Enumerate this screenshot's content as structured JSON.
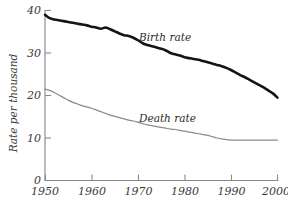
{
  "chart_data": {
    "type": "line",
    "title": "",
    "xlabel": "",
    "ylabel": "Rate per thousand",
    "xlim": [
      1950,
      2000
    ],
    "ylim": [
      0,
      40
    ],
    "grid": false,
    "legend_position": "inline-annotations",
    "x_ticks": [
      "1950",
      "1960",
      "1970",
      "1980",
      "1990",
      "2000"
    ],
    "x_tick_values": [
      1950,
      1960,
      1970,
      1980,
      1990,
      2000
    ],
    "y_ticks": [
      "0",
      "10",
      "20",
      "30",
      "40"
    ],
    "y_tick_values": [
      0,
      10,
      20,
      30,
      40
    ],
    "series": [
      {
        "name": "Birth rate",
        "color": "#141414",
        "annotation": "Birth rate",
        "x": [
          1950,
          1951,
          1952,
          1953,
          1954,
          1955,
          1956,
          1957,
          1958,
          1959,
          1960,
          1961,
          1962,
          1963,
          1964,
          1965,
          1966,
          1967,
          1968,
          1969,
          1970,
          1971,
          1972,
          1973,
          1974,
          1975,
          1976,
          1977,
          1978,
          1979,
          1980,
          1981,
          1982,
          1983,
          1984,
          1985,
          1986,
          1987,
          1988,
          1989,
          1990,
          1991,
          1992,
          1993,
          1994,
          1995,
          1996,
          1997,
          1998,
          1999,
          2000
        ],
        "values": [
          39.0,
          38.2,
          37.9,
          37.7,
          37.5,
          37.3,
          37.1,
          36.9,
          36.7,
          36.5,
          36.2,
          36.0,
          35.7,
          36.0,
          35.6,
          35.1,
          34.6,
          34.2,
          34.0,
          33.6,
          33.0,
          32.3,
          31.9,
          31.6,
          31.3,
          31.0,
          30.6,
          30.0,
          29.7,
          29.4,
          29.0,
          28.8,
          28.6,
          28.4,
          28.1,
          27.8,
          27.5,
          27.2,
          26.9,
          26.5,
          26.0,
          25.4,
          24.8,
          24.3,
          23.7,
          23.1,
          22.5,
          21.9,
          21.2,
          20.5,
          19.5
        ]
      },
      {
        "name": "Death rate",
        "color": "#8c8c8c",
        "annotation": "Death rate",
        "x": [
          1950,
          1951,
          1952,
          1953,
          1954,
          1955,
          1956,
          1957,
          1958,
          1959,
          1960,
          1961,
          1962,
          1963,
          1964,
          1965,
          1966,
          1967,
          1968,
          1969,
          1970,
          1971,
          1972,
          1973,
          1974,
          1975,
          1976,
          1977,
          1978,
          1979,
          1980,
          1981,
          1982,
          1983,
          1984,
          1985,
          1986,
          1987,
          1988,
          1989,
          1990,
          1991,
          1992,
          1993,
          1994,
          1995,
          1996,
          1997,
          1998,
          1999,
          2000
        ],
        "values": [
          21.5,
          21.2,
          20.7,
          20.1,
          19.5,
          18.9,
          18.4,
          18.0,
          17.6,
          17.3,
          17.0,
          16.6,
          16.2,
          15.8,
          15.4,
          15.1,
          14.8,
          14.5,
          14.2,
          14.0,
          13.7,
          13.4,
          13.1,
          12.9,
          12.7,
          12.5,
          12.3,
          12.1,
          12.0,
          11.8,
          11.6,
          11.4,
          11.2,
          11.0,
          10.8,
          10.6,
          10.3,
          10.0,
          9.8,
          9.6,
          9.5,
          9.5,
          9.5,
          9.5,
          9.5,
          9.5,
          9.5,
          9.5,
          9.5,
          9.5,
          9.5
        ]
      }
    ]
  },
  "annotations": {
    "birth_label": "Birth rate",
    "death_label": "Death rate",
    "y_axis_title": "Rate per thousand"
  },
  "colors": {
    "birth_line": "#141414",
    "death_line": "#8c8c8c",
    "axis": "#8a8a8a",
    "text": "#3a3a3a",
    "background": "#ffffff"
  }
}
